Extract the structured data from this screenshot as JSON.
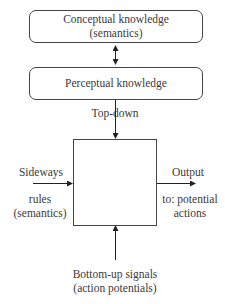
{
  "diagram": {
    "conceptual": {
      "line1": "Conceptual knowledge",
      "line2": "(semantics)"
    },
    "perceptual": {
      "label": "Perceptual knowledge"
    },
    "top_down": {
      "label": "Top-down"
    },
    "sideways": {
      "label": "Sideways",
      "line1": "rules",
      "line2": "(semantics)"
    },
    "output": {
      "label": "Output",
      "line1": "to: potential",
      "line2": "actions"
    },
    "bottom_up": {
      "line1": "Bottom-up signals",
      "line2": "(action potentials)"
    },
    "colors": {
      "stroke": "#444444",
      "text": "#3a3a3a",
      "background": "#ffffff"
    }
  }
}
